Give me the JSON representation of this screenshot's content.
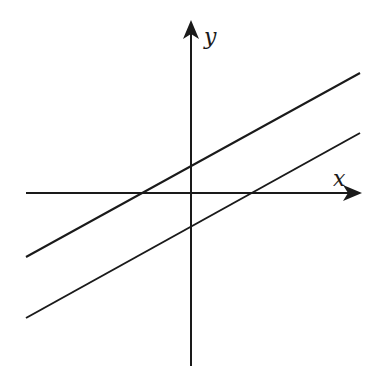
{
  "diagram": {
    "type": "coordinate-plane",
    "axes": {
      "x_label": "x",
      "y_label": "y"
    },
    "lines": [
      {
        "name": "upper-line",
        "description": "positive slope, positive y-intercept"
      },
      {
        "name": "lower-line",
        "description": "parallel, positive slope, negative y-intercept"
      }
    ],
    "colors": {
      "stroke": "#1a1a1a",
      "background": "#ffffff"
    }
  }
}
